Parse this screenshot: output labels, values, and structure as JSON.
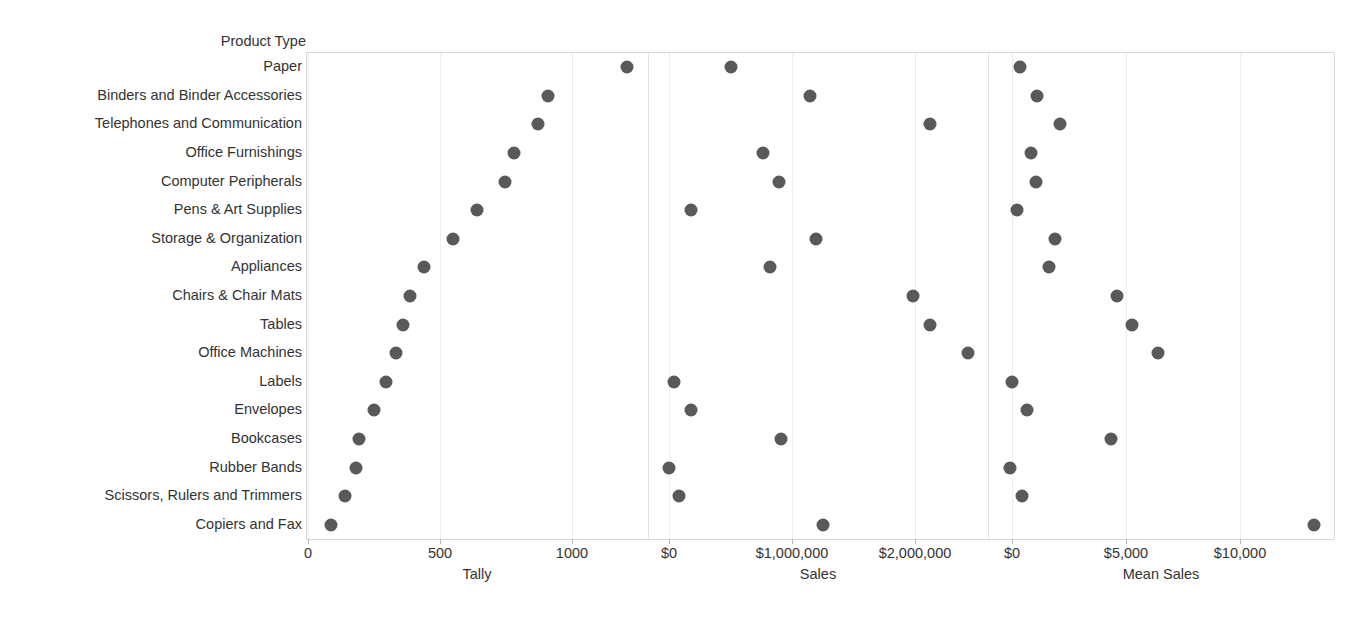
{
  "chart_data": {
    "type": "scatter",
    "title": "",
    "row_field_label": "Product Type",
    "categories": [
      "Paper",
      "Binders and Binder Accessories",
      "Telephones and Communication",
      "Office Furnishings",
      "Computer Peripherals",
      "Pens & Art Supplies",
      "Storage & Organization",
      "Appliances",
      "Chairs & Chair Mats",
      "Tables",
      "Office Machines",
      "Labels",
      "Envelopes",
      "Bookcases",
      "Rubber Bands",
      "Scissors, Rulers and Trimmers",
      "Copiers and Fax"
    ],
    "grid": true,
    "legend": "none",
    "marker_color": "#595959",
    "panels": [
      {
        "name": "tally",
        "xlabel": "Tally",
        "ticks": [
          0,
          500,
          1000
        ],
        "tick_labels": [
          "0",
          "500",
          "1000"
        ],
        "xlim": [
          0,
          1280
        ],
        "values": [
          1208,
          908,
          872,
          781,
          746,
          640,
          549,
          439,
          386,
          360,
          333,
          295,
          250,
          193,
          182,
          140,
          87
        ]
      },
      {
        "name": "sales",
        "xlabel": "Sales",
        "ticks": [
          0,
          1000000,
          2000000
        ],
        "tick_labels": [
          "$0",
          "$1,000,000",
          "$2,000,000"
        ],
        "xlim": [
          0,
          2600000
        ],
        "values": [
          504000,
          1146000,
          2122000,
          764000,
          894000,
          179000,
          1195000,
          821000,
          1984000,
          2122000,
          2431000,
          41000,
          179000,
          911000,
          0,
          81000,
          1252000
        ]
      },
      {
        "name": "mean_sales",
        "xlabel": "Mean Sales",
        "ticks": [
          0,
          5000,
          10000
        ],
        "tick_labels": [
          "$0",
          "$5,000",
          "$10,000"
        ],
        "xlim": [
          0,
          13900
        ],
        "values": [
          354,
          1106,
          2124,
          841,
          1062,
          221,
          1903,
          1637,
          4602,
          5265,
          6416,
          0,
          664,
          4336,
          -88,
          442,
          13230
        ]
      }
    ]
  }
}
